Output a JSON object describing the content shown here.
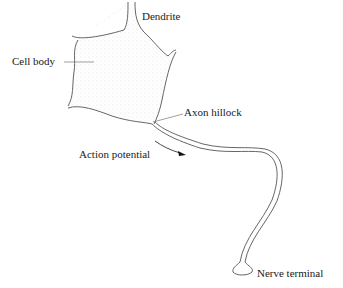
{
  "diagram": {
    "labels": {
      "dendrite": "Dendrite",
      "cell_body": "Cell body",
      "axon_hillock": "Axon hillock",
      "action_potential": "Action potential",
      "nerve_terminal": "Nerve terminal"
    },
    "colors": {
      "outline": "#555555",
      "fill_stipple": "#e6e6e6",
      "text": "#1a1a1a",
      "arrow": "#111111"
    }
  }
}
